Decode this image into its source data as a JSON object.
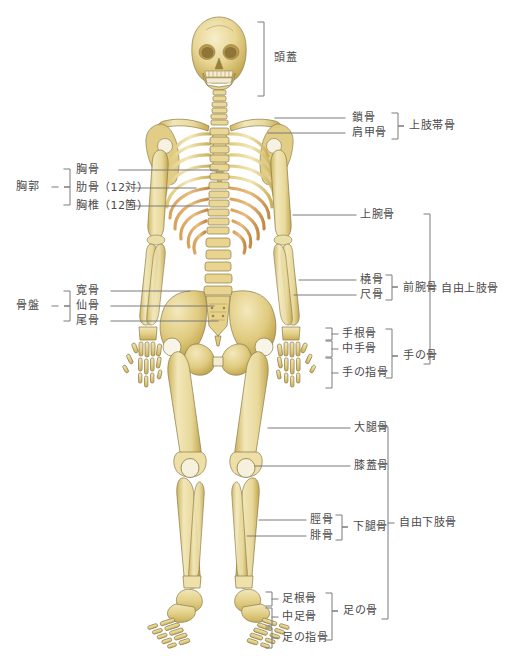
{
  "diagram": {
    "language": "ja"
  },
  "colors": {
    "bone_light": "#f2e7b8",
    "bone_mid": "#e3d089",
    "bone_shade": "#cdb45e",
    "bone_deep": "#b79a45",
    "rib_orange": "#d9a05a",
    "cartilage": "#f7f5ee",
    "outline": "#8a7a46",
    "leader_line": "#7a7a7a",
    "text": "#4a4a4a",
    "background": "#ffffff"
  },
  "labels": {
    "skull": "頭蓋",
    "clavicle": "鎖骨",
    "scapula": "肩甲骨",
    "shoulder_girdle": "上肢帯骨",
    "thorax": "胸郭",
    "sternum": "胸骨",
    "ribs": "肋骨（12対）",
    "thoracic_vertebrae": "胸椎（12箇）",
    "humerus": "上腕骨",
    "radius": "橈骨",
    "ulna": "尺骨",
    "forearm_bones": "前腕骨",
    "free_upper_limb": "自由上肢骨",
    "pelvis": "骨盤",
    "hip_bone": "寛骨",
    "sacrum": "仙骨",
    "coccyx": "尾骨",
    "carpals": "手根骨",
    "metacarpals": "中手骨",
    "hand_phalanges": "手の指骨",
    "hand_bones": "手の骨",
    "femur": "大腿骨",
    "patella": "膝蓋骨",
    "tibia": "脛骨",
    "fibula": "腓骨",
    "lower_leg_bones": "下腿骨",
    "free_lower_limb": "自由下肢骨",
    "tarsals": "足根骨",
    "metatarsals": "中足骨",
    "foot_phalanges": "足の指骨",
    "foot_bones": "足の骨"
  }
}
